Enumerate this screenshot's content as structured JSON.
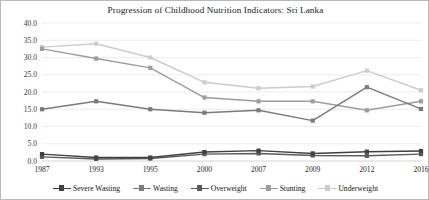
{
  "chart_data": {
    "type": "line",
    "title": "Progression of Childhood Nutrition Indicators: Sri Lanka",
    "xlabel": "",
    "ylabel": "",
    "categories": [
      "1987",
      "1993",
      "1995",
      "2000",
      "2007",
      "2009",
      "2012",
      "2016"
    ],
    "ylim": [
      0.0,
      40.0
    ],
    "ytick_labels": [
      "0.0",
      "5.0",
      "10.0",
      "15.0",
      "20.0",
      "25.0",
      "30.0",
      "35.0",
      "40.0"
    ],
    "ytick_values": [
      0.0,
      5.0,
      10.0,
      15.0,
      20.0,
      25.0,
      30.0,
      35.0,
      40.0
    ],
    "grid": true,
    "legend_position": "bottom",
    "series": [
      {
        "name": "Severe Wasting",
        "color": "#404040",
        "values": [
          2.0,
          1.0,
          1.0,
          2.6,
          3.0,
          2.2,
          2.7,
          2.9
        ]
      },
      {
        "name": "Wasting",
        "color": "#7b7b7b",
        "values": [
          15.0,
          17.3,
          15.0,
          14.0,
          14.7,
          11.7,
          21.4,
          15.1
        ]
      },
      {
        "name": "Overweight",
        "color": "#5a5a5a",
        "values": [
          1.2,
          0.6,
          0.7,
          2.0,
          2.2,
          1.6,
          1.5,
          2.0
        ]
      },
      {
        "name": "Stunting",
        "color": "#9d9d9d",
        "values": [
          32.5,
          29.7,
          27.0,
          18.4,
          17.3,
          17.3,
          14.7,
          17.3
        ]
      },
      {
        "name": "Underweight",
        "color": "#cccccc",
        "values": [
          33.0,
          34.0,
          30.0,
          22.8,
          21.1,
          21.6,
          26.2,
          20.5
        ]
      }
    ]
  },
  "legend": {
    "items": [
      {
        "label": "Severe Wasting"
      },
      {
        "label": "Wasting"
      },
      {
        "label": "Overweight"
      },
      {
        "label": "Stunting"
      },
      {
        "label": "Underweight"
      }
    ]
  }
}
